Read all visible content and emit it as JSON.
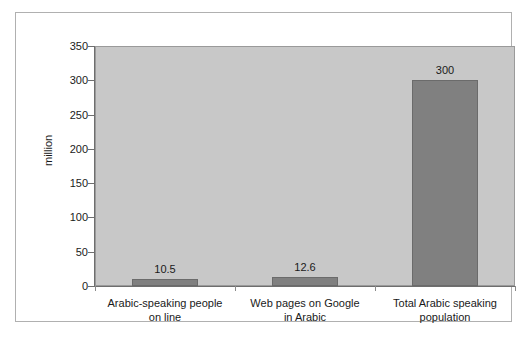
{
  "chart_data": {
    "type": "bar",
    "title": "",
    "subtitle": "",
    "xlabel": "",
    "ylabel": "million",
    "categories": [
      "Arabic-speaking people on line",
      "Web pages on Google in Arabic",
      "Total Arabic speaking population"
    ],
    "category_lines": [
      [
        "Arabic-speaking people",
        "on line"
      ],
      [
        "Web pages on Google",
        "in Arabic"
      ],
      [
        "Total Arabic speaking",
        "population"
      ]
    ],
    "values": [
      10.5,
      12.6,
      300
    ],
    "value_labels": [
      "10.5",
      "12.6",
      "300"
    ],
    "ylim": [
      0,
      350
    ],
    "ytick_values": [
      0,
      50,
      100,
      150,
      200,
      250,
      300,
      350
    ],
    "ytick_labels": [
      "0",
      "50",
      "100",
      "150",
      "200",
      "250",
      "300",
      "350"
    ],
    "grid": false,
    "legend": false,
    "legend_position": "none",
    "colors": {
      "bar_fill": "#808080",
      "bar_edge": "#6b6b6b",
      "plot_background": "#c8c8c8",
      "figure_background": "#ffffff",
      "axis_line": "#6e6e6e",
      "frame_border": "#b0b0b0",
      "text": "#1a1a1a"
    }
  }
}
